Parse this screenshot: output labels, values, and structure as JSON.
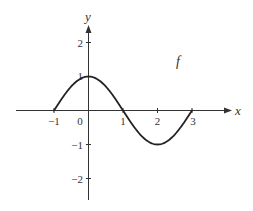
{
  "chart_data": {
    "type": "line",
    "title": "",
    "xlabel": "x",
    "ylabel": "y",
    "function_label": "f",
    "function_description": "f(x) = cos(pi*x/2) on [-1, 3]",
    "xlim": [
      -2.1,
      4.2
    ],
    "ylim": [
      -2.6,
      2.5
    ],
    "x_ticks": [
      -1,
      0,
      1,
      2,
      3
    ],
    "x_tick_labels": [
      "-1",
      "0",
      "1",
      "2",
      "3"
    ],
    "y_ticks": [
      -2,
      -1,
      1,
      2
    ],
    "y_tick_labels": [
      "-2",
      "-1",
      "1",
      "2"
    ],
    "grid": false,
    "legend": "none",
    "series": [
      {
        "name": "f",
        "x": [
          -1,
          -0.5,
          0,
          0.5,
          1,
          1.5,
          2,
          2.5,
          3
        ],
        "y": [
          0,
          0.707,
          1,
          0.707,
          0,
          -0.707,
          -1,
          -0.707,
          0
        ]
      }
    ],
    "key_points": [
      {
        "x": -1,
        "y": 0
      },
      {
        "x": 0,
        "y": 1
      },
      {
        "x": 1,
        "y": 0
      },
      {
        "x": 2,
        "y": -1
      },
      {
        "x": 3,
        "y": 0
      }
    ]
  },
  "labels": {
    "x_axis": "x",
    "y_axis": "y",
    "function": "f",
    "x_ticks": [
      "−1",
      "0",
      "1",
      "2",
      "3"
    ],
    "y_ticks": [
      "2",
      "1",
      "−1",
      "−2"
    ]
  },
  "colors": {
    "axis": "#333333",
    "curve": "#222222",
    "background": "#ffffff"
  }
}
